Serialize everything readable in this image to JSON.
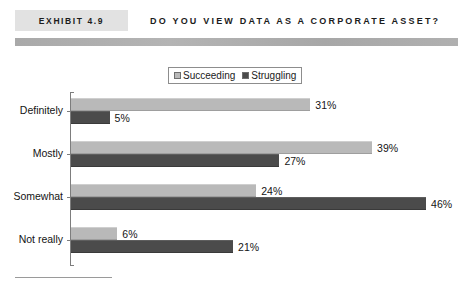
{
  "header": {
    "exhibit_label": "EXHIBIT 4.9",
    "title": "DO YOU VIEW DATA AS A CORPORATE ASSET?"
  },
  "legend": {
    "items": [
      {
        "label": "Succeeding",
        "color": "#b9b9b9",
        "swatch_name": "legend-swatch-succeeding"
      },
      {
        "label": "Struggling",
        "color": "#4b4b4b",
        "swatch_name": "legend-swatch-struggling"
      }
    ]
  },
  "chart_data": {
    "type": "bar",
    "orientation": "horizontal",
    "title": "DO YOU VIEW DATA AS A CORPORATE ASSET?",
    "xlabel": "",
    "ylabel": "",
    "xlim": [
      0,
      50
    ],
    "grid": false,
    "legend_position": "top-center",
    "categories": [
      "Definitely",
      "Mostly",
      "Somewhat",
      "Not really"
    ],
    "series": [
      {
        "name": "Succeeding",
        "color": "#b9b9b9",
        "values": [
          31,
          39,
          24,
          6
        ],
        "labels": [
          "31%",
          "39%",
          "24%",
          "6%"
        ]
      },
      {
        "name": "Struggling",
        "color": "#4b4b4b",
        "values": [
          5,
          27,
          46,
          21
        ],
        "labels": [
          "5%",
          "27%",
          "46%",
          "21%"
        ]
      }
    ]
  }
}
